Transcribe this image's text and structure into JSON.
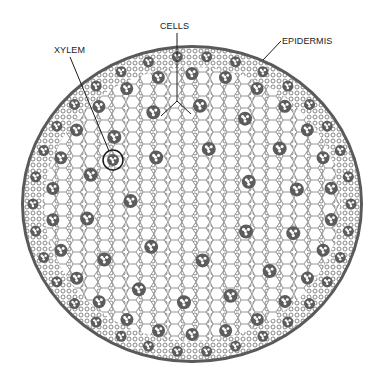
{
  "diagram": {
    "labels": [
      {
        "id": "xylem",
        "text": "XYLEM",
        "x": 54,
        "y": 46
      },
      {
        "id": "cells",
        "text": "CELLS",
        "x": 160,
        "y": 22
      },
      {
        "id": "epidermis",
        "text": "EPIDERMIS",
        "x": 282,
        "y": 37
      }
    ],
    "colors": {
      "epidermis": "#5a5a5a",
      "cell_wall": "#7a7a7a",
      "bundle": "#555555",
      "leader": "#1a1a1a",
      "background": "#ffffff"
    },
    "section": {
      "cx": 192,
      "cy": 204,
      "rx": 171,
      "ry": 159
    },
    "xylem_marker": {
      "cx": 113,
      "cy": 160,
      "r": 10
    }
  }
}
